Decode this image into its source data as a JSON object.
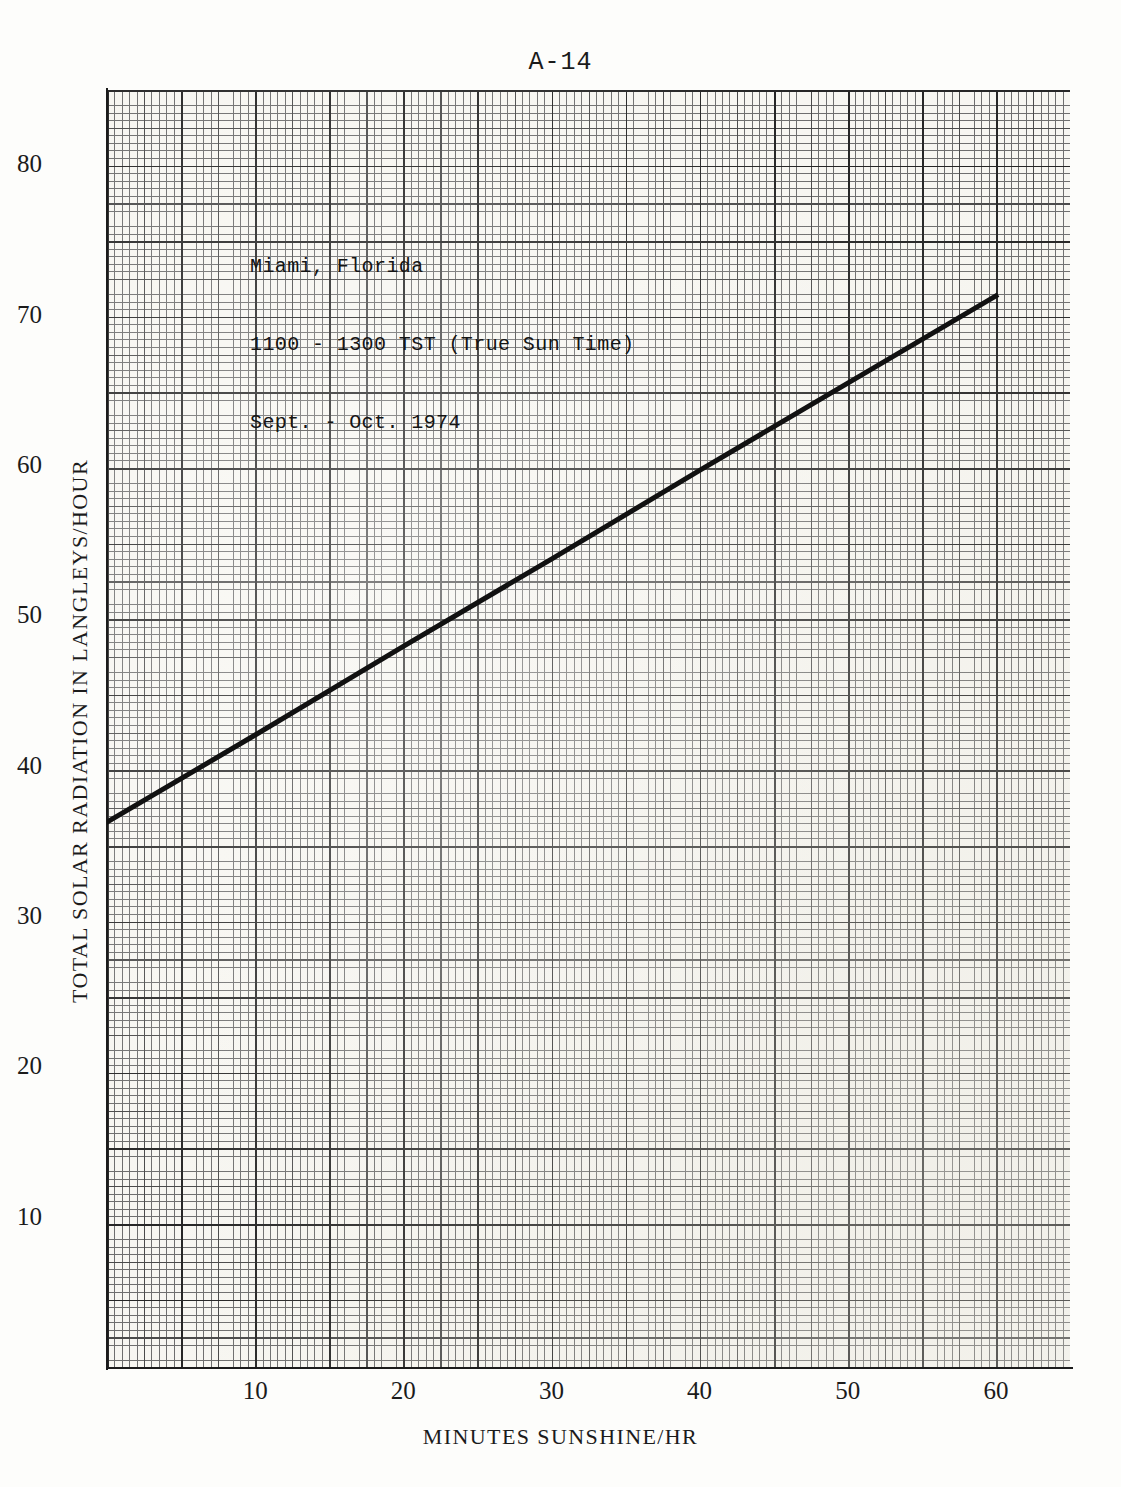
{
  "page": {
    "number": "A-14"
  },
  "chart_data": {
    "type": "line",
    "title": "",
    "xlabel": "MINUTES SUNSHINE/HR",
    "ylabel": "TOTAL SOLAR RADIATION IN LANGLEYS/HOUR",
    "xlim": [
      0,
      65
    ],
    "ylim": [
      0,
      85
    ],
    "xticks": [
      10,
      20,
      30,
      40,
      50,
      60
    ],
    "xtick_labels": [
      "10",
      "20",
      "30",
      "40",
      "50",
      "60"
    ],
    "yticks": [
      10,
      20,
      30,
      40,
      50,
      60,
      70,
      80
    ],
    "ytick_labels": [
      "10",
      "20",
      "30",
      "40",
      "50",
      "60",
      "70",
      "80"
    ],
    "grid": "graph-paper-fine-medium-heavy",
    "legend": "none",
    "series": [
      {
        "name": "Miami regression line",
        "x": [
          0,
          10,
          20,
          30,
          40,
          50,
          60
        ],
        "values": [
          36.3,
          42.1,
          48.0,
          53.8,
          59.7,
          65.5,
          71.3
        ],
        "line_color": "#111111",
        "line_width_px": 5
      }
    ],
    "annotations": [
      "Miami, Florida",
      "1100 - 1300 TST (True Sun Time)",
      "Sept. - Oct. 1974"
    ]
  },
  "annotation": {
    "line1": "Miami, Florida",
    "line2": "1100 - 1300 TST (True Sun Time)",
    "line3": "Sept. - Oct. 1974"
  },
  "colors": {
    "paper": "#f7f6f1",
    "grid_fine": "#6e6e6e",
    "grid_medium": "#4a4a4a",
    "grid_heavy": "#262626",
    "axis": "#1b1b1b",
    "data_line": "#111111"
  }
}
